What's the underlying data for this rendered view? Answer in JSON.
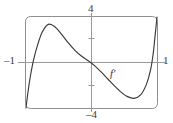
{
  "figure": {
    "kind": "calculus-derivative-graph",
    "curve_label": "f′"
  },
  "labels": {
    "top": "4",
    "bottom": "–4",
    "left": "–1",
    "right": "1"
  },
  "colors": {
    "curve": "#3a3a3a",
    "axis": "#9a9a9a",
    "frame": "#8f8f8f",
    "background": "#ffffff",
    "text": "#3a3a3a"
  },
  "chart_data": {
    "type": "line",
    "title": "",
    "xlabel": "",
    "ylabel": "",
    "xlim": [
      -1,
      1
    ],
    "ylim": [
      -4,
      4
    ],
    "grid": false,
    "legend": "none",
    "annotations": [
      {
        "text": "f′",
        "x": 0.3,
        "y": -1.3
      }
    ],
    "xticks": [
      -1,
      1
    ],
    "xticklabels": [
      "–1",
      "1"
    ],
    "yticks": [
      -4,
      -2,
      2,
      4
    ],
    "yticklabels": [
      "–4",
      "",
      "",
      "4"
    ],
    "series": [
      {
        "name": "f′",
        "x": [
          -1.0,
          -0.97,
          -0.93,
          -0.88,
          -0.82,
          -0.75,
          -0.66,
          -0.56,
          -0.46,
          -0.35,
          -0.25,
          -0.15,
          -0.05,
          0.05,
          0.15,
          0.25,
          0.35,
          0.45,
          0.55,
          0.65,
          0.75,
          0.84,
          0.9,
          0.94,
          0.97,
          1.0
        ],
        "y": [
          -4.0,
          -2.6,
          -1.1,
          0.35,
          1.6,
          2.7,
          3.35,
          3.15,
          2.5,
          1.7,
          1.05,
          0.55,
          0.15,
          -0.3,
          -0.85,
          -1.45,
          -2.05,
          -2.6,
          -3.0,
          -3.15,
          -2.85,
          -1.9,
          -0.7,
          0.7,
          2.3,
          4.0
        ]
      }
    ]
  }
}
